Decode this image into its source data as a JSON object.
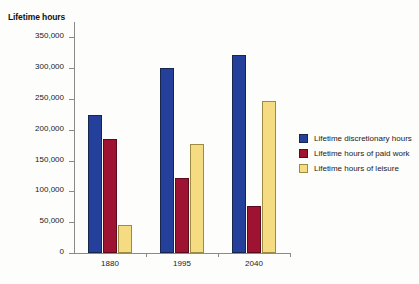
{
  "chart_data": {
    "type": "bar",
    "title": "",
    "subtitle": "",
    "xlabel": "",
    "ylabel": "Lifetime hours",
    "categories": [
      "1880",
      "1995",
      "2040"
    ],
    "series": [
      {
        "name": "Lifetime discretionary hours",
        "color": "#24409A",
        "values": [
          224000,
          301000,
          322000
        ]
      },
      {
        "name": "Lifetime hours of paid work",
        "color": "#9E1232",
        "values": [
          185000,
          122000,
          76000
        ]
      },
      {
        "name": "Lifetime hours of leisure",
        "color": "#F5DC82",
        "values": [
          45000,
          177000,
          247000
        ]
      }
    ],
    "ylim": [
      0,
      375000
    ],
    "ytick_values": [
      0,
      50000,
      100000,
      150000,
      200000,
      250000,
      300000,
      350000
    ],
    "ytick_labels": [
      "0",
      "50,000",
      "100,000",
      "150,000",
      "200,000",
      "250,000",
      "300,000",
      "350,000"
    ],
    "grid": false,
    "legend_position": "right"
  },
  "legend": {
    "entries": [
      "Lifetime discretionary hours",
      "Lifetime hours of paid work",
      "Lifetime hours of leisure"
    ]
  }
}
